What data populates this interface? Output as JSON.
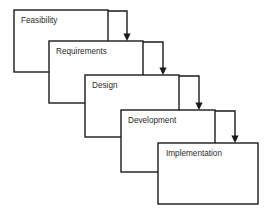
{
  "diagram": {
    "type": "waterfall-process-diagram",
    "canvas": {
      "width": 275,
      "height": 214,
      "background": "#ffffff"
    },
    "style": {
      "box_fill": "#ffffff",
      "box_stroke": "#1a1a1a",
      "box_stroke_width": 1.4,
      "label_color": "#2b2b2b",
      "connector_color": "#1a1a1a"
    },
    "box_size": {
      "width": 94,
      "height": 62
    },
    "offset": {
      "x": 35,
      "y": 34
    },
    "stages": [
      {
        "id": "feasibility",
        "label": "Feasibility",
        "order": 1,
        "x": 14,
        "y": 10,
        "width": 94,
        "height": 62,
        "label_x": 21,
        "label_y": 21
      },
      {
        "id": "requirements",
        "label": "Requirements",
        "order": 2,
        "x": 49,
        "y": 41,
        "width": 94,
        "height": 62,
        "label_x": 56,
        "label_y": 52
      },
      {
        "id": "design",
        "label": "Design",
        "order": 3,
        "x": 85,
        "y": 75,
        "width": 94,
        "height": 62,
        "label_x": 92,
        "label_y": 86
      },
      {
        "id": "development",
        "label": "Development",
        "order": 4,
        "x": 121,
        "y": 110,
        "width": 94,
        "height": 62,
        "label_x": 128,
        "label_y": 121
      },
      {
        "id": "implementation",
        "label": "Implementation",
        "order": 5,
        "x": 158,
        "y": 143,
        "width": 100,
        "height": 61,
        "label_x": 166,
        "label_y": 154
      }
    ],
    "connectors": [
      {
        "id": "feasibility-to-requirements",
        "from": "feasibility",
        "to": "requirements",
        "path": "M 108 11 L 127 11 L 127 35",
        "arrow": "127,41 123.4,33.5 130.6,33.5"
      },
      {
        "id": "requirements-to-design",
        "from": "requirements",
        "to": "design",
        "path": "M 143 42 L 163 42 L 163 69",
        "arrow": "163,75 159.4,67.5 166.6,67.5"
      },
      {
        "id": "design-to-development",
        "from": "design",
        "to": "development",
        "path": "M 179 76 L 199 76 L 199 104",
        "arrow": "199,110 195.4,102.5 202.6,102.5"
      },
      {
        "id": "development-to-implementation",
        "from": "development",
        "to": "implementation",
        "path": "M 215 111 L 235 111 L 235 137",
        "arrow": "235,143 231.4,135.5 238.6,135.5"
      }
    ]
  }
}
